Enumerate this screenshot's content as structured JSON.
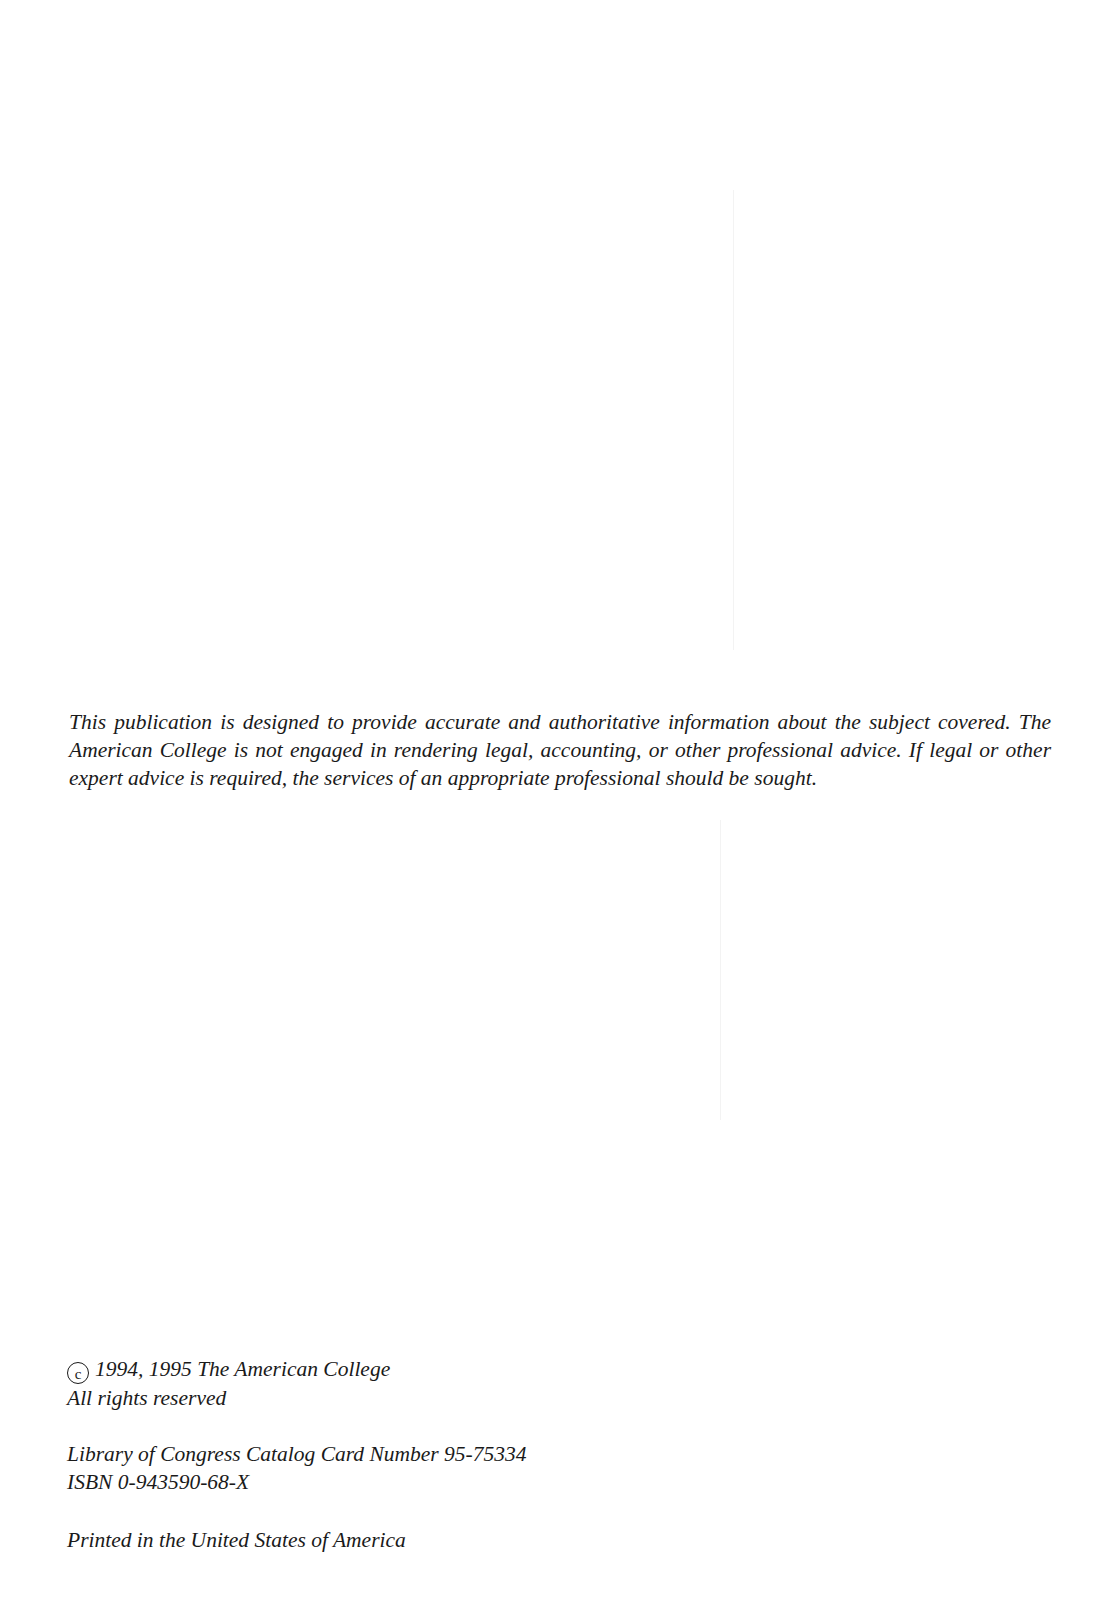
{
  "disclaimer": {
    "text": "This publication is designed to provide accurate and authoritative information about the subject covered. The American College is not engaged in rendering legal, accounting, or other professional advice. If legal or other expert advice is required, the services of an appropriate professional should be sought."
  },
  "copyright": {
    "symbol": "c",
    "line": "1994, 1995 The American College",
    "rights": "All rights reserved"
  },
  "catalog": {
    "lccn": "Library of Congress Catalog Card Number 95-75334",
    "isbn": "ISBN 0-943590-68-X"
  },
  "printed": {
    "text": "Printed in the United States of America"
  }
}
